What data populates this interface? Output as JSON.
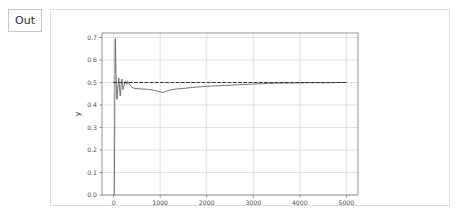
{
  "cell": {
    "out_label": "Out",
    "icon": "output-bracket"
  },
  "colors": {
    "panel_border": "#dcdcdc",
    "out_box_border": "#c8c8c8",
    "grid": "#d4d4d4",
    "axis": "#7a7a7a",
    "curve": "#5a5a5a",
    "reference_line": "#333333",
    "text": "#4d4d4d",
    "background": "#ffffff"
  },
  "chart_data": {
    "type": "line",
    "title": "",
    "xlabel": "x",
    "ylabel": "y",
    "xlim": [
      -250,
      5250
    ],
    "ylim": [
      0.0,
      0.72
    ],
    "grid": true,
    "legend": null,
    "xticks": [
      0,
      1000,
      2000,
      3000,
      4000,
      5000
    ],
    "xtick_labels": [
      "0",
      "1000",
      "2000",
      "3000",
      "4000",
      "5000"
    ],
    "yticks": [
      0.0,
      0.1,
      0.2,
      0.3,
      0.4,
      0.5,
      0.6,
      0.7
    ],
    "ytick_labels": [
      "0.0",
      "0.1",
      "0.2",
      "0.3",
      "0.4",
      "0.5",
      "0.6",
      "0.7"
    ],
    "annotations": [
      {
        "name": "convergence-target",
        "text": "",
        "value": 0.5,
        "style": "dashed-horizontal-line"
      }
    ],
    "series": [
      {
        "name": "running-average",
        "style": "solid",
        "color": "#5a5a5a",
        "x": [
          1,
          5,
          10,
          15,
          20,
          25,
          30,
          35,
          40,
          45,
          50,
          60,
          70,
          80,
          90,
          100,
          110,
          120,
          130,
          140,
          150,
          160,
          170,
          180,
          190,
          200,
          220,
          240,
          260,
          280,
          300,
          330,
          360,
          400,
          450,
          500,
          560,
          620,
          700,
          800,
          900,
          1000,
          1050,
          1100,
          1150,
          1200,
          1300,
          1400,
          1500,
          1600,
          1700,
          1800,
          1900,
          2000,
          2100,
          2200,
          2300,
          2400,
          2500,
          2600,
          2700,
          2800,
          2900,
          3000,
          3100,
          3200,
          3300,
          3400,
          3500,
          3600,
          3800,
          4000,
          4200,
          4400,
          4600,
          4800,
          5000
        ],
        "y": [
          0.0,
          0.0,
          0.0,
          0.02,
          0.18,
          0.42,
          0.6,
          0.695,
          0.66,
          0.6,
          0.54,
          0.47,
          0.425,
          0.445,
          0.48,
          0.5,
          0.52,
          0.495,
          0.465,
          0.44,
          0.455,
          0.49,
          0.505,
          0.515,
          0.49,
          0.468,
          0.482,
          0.505,
          0.5,
          0.492,
          0.505,
          0.496,
          0.487,
          0.478,
          0.474,
          0.473,
          0.472,
          0.471,
          0.47,
          0.468,
          0.464,
          0.458,
          0.456,
          0.458,
          0.463,
          0.466,
          0.47,
          0.472,
          0.474,
          0.476,
          0.478,
          0.48,
          0.481,
          0.483,
          0.484,
          0.485,
          0.486,
          0.487,
          0.488,
          0.489,
          0.49,
          0.491,
          0.492,
          0.493,
          0.494,
          0.495,
          0.496,
          0.496,
          0.497,
          0.497,
          0.498,
          0.498,
          0.499,
          0.499,
          0.499,
          0.5,
          0.5
        ]
      },
      {
        "name": "reference-0.5",
        "style": "dashed",
        "color": "#333333",
        "x": [
          0,
          5000
        ],
        "y": [
          0.5,
          0.5
        ]
      }
    ]
  }
}
